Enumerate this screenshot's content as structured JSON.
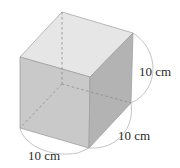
{
  "diagram": {
    "type": "cube",
    "labels": {
      "height": "10 cm",
      "depth": "10 cm",
      "width": "10 cm"
    },
    "colors": {
      "top_face": "#e6e6e6",
      "front_face": "#c9c9c9",
      "right_face": "#b0b0b0",
      "edge": "#9a9a9a",
      "hidden_edge": "#8a8a8a",
      "arc": "#b5b5b5",
      "text": "#2a2a2a"
    }
  }
}
